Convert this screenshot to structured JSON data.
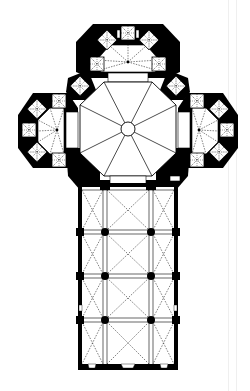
{
  "figure": {
    "type": "architectural-floor-plan",
    "colors": {
      "background": "#ffffff",
      "wall": "#000000",
      "vault_line": "#000000",
      "edge_line": "#efefef"
    },
    "crossing": {
      "shape": "octagon",
      "cx": 128,
      "cy": 129,
      "r": 58,
      "oculus_r": 8,
      "ribs": 8
    },
    "apses": [
      {
        "name": "north-apse",
        "cx": 128,
        "cy": 62
      },
      {
        "name": "west-apse",
        "cx": 57,
        "cy": 130
      },
      {
        "name": "east-apse",
        "cx": 199,
        "cy": 130
      }
    ],
    "nave": {
      "x": 78,
      "y": 183,
      "width": 100,
      "height": 187,
      "bays": 4,
      "aisles": 3,
      "pier_rows_y": [
        232,
        276,
        320
      ],
      "pier_cols_x": [
        105,
        151
      ]
    }
  }
}
